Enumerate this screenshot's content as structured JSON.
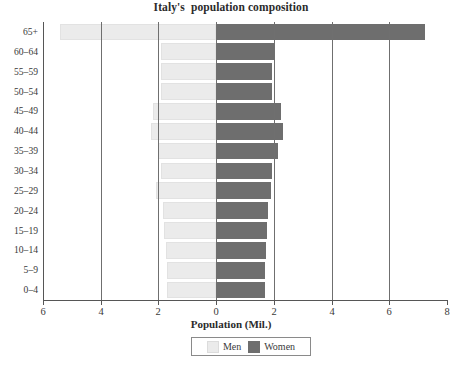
{
  "chart_data": {
    "type": "bar",
    "subtype": "population-pyramid",
    "title": "Italy's  population composition",
    "xlabel": "Population (Mil.)",
    "ylabel": "",
    "grid": true,
    "legend_position": "bottom",
    "xlim": [
      -6,
      8
    ],
    "x_tick_values": [
      -6,
      -4,
      -2,
      0,
      2,
      4,
      6,
      8
    ],
    "x_tick_labels": [
      "6",
      "4",
      "2",
      "0",
      "2",
      "4",
      "6",
      "8"
    ],
    "categories": [
      "65+",
      "60–64",
      "55–59",
      "50–54",
      "45–49",
      "40–44",
      "35–39",
      "30–34",
      "25–29",
      "20–24",
      "15–19",
      "10–14",
      "5–9",
      "0–4"
    ],
    "series": [
      {
        "name": "Men",
        "color": "#ebebeb",
        "direction": "left",
        "values": [
          5.4,
          1.9,
          1.9,
          1.9,
          2.2,
          2.25,
          2.0,
          1.9,
          2.1,
          1.85,
          1.8,
          1.75,
          1.7,
          1.7
        ]
      },
      {
        "name": "Women",
        "color": "#6e6e6e",
        "direction": "right",
        "values": [
          7.25,
          2.0,
          1.95,
          1.95,
          2.25,
          2.3,
          2.15,
          1.95,
          1.9,
          1.8,
          1.75,
          1.72,
          1.7,
          1.68
        ]
      }
    ]
  },
  "legend": {
    "items": [
      {
        "label": "Men",
        "color": "#ebebeb"
      },
      {
        "label": "Women",
        "color": "#6e6e6e"
      }
    ]
  },
  "colors": {
    "men": "#ebebeb",
    "women": "#6e6e6e",
    "axis": "#565656",
    "grid": "#6f6f6f",
    "text": "#3a3a3a",
    "background": "#ffffff"
  }
}
